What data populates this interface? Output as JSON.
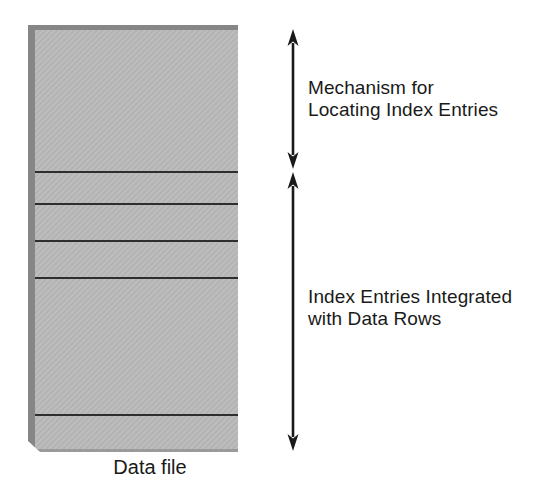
{
  "figure": {
    "caption": "Data file",
    "annotations": {
      "top": {
        "label": "Mechanism for\nLocating Index Entries"
      },
      "bottom": {
        "label": "Index Entries Integrated\nwith Data Rows"
      }
    },
    "box": {
      "divider_offsets_px": [
        146,
        178,
        215,
        252,
        389
      ],
      "segment_count": 6
    },
    "colors": {
      "background": "#ffffff",
      "box_fill": "#bdbdbd",
      "box_fill_alt": "#b0b0b0",
      "box_edge": "#868686",
      "box_bottom_edge": "#9a9a9a",
      "divider": "#2e2e2e",
      "ink": "#1a1a1a"
    }
  }
}
